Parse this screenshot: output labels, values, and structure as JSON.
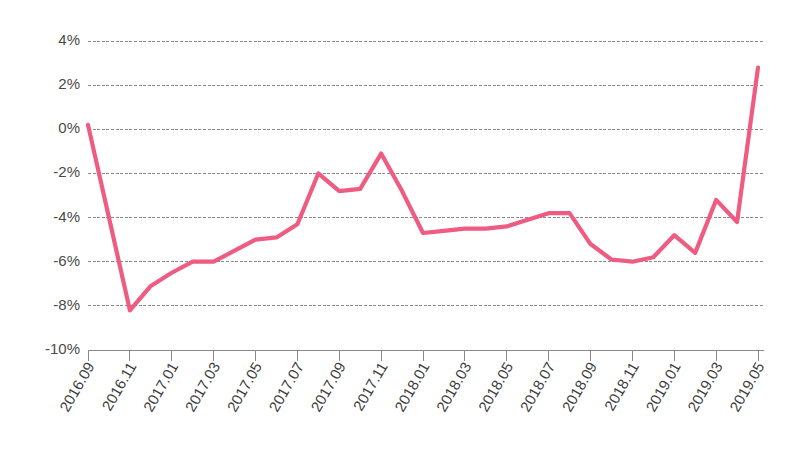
{
  "chart_data": {
    "type": "line",
    "title": "",
    "subtitle": "",
    "xlabel": "",
    "ylabel": "",
    "ylim": [
      -10,
      4
    ],
    "ytick_labels": [
      "4%",
      "2%",
      "0%",
      "-2%",
      "-4%",
      "-6%",
      "-8%",
      "-10%"
    ],
    "ytick_values": [
      4,
      2,
      0,
      -2,
      -4,
      -6,
      -8,
      -10
    ],
    "grid": true,
    "legend": false,
    "legend_position": "none",
    "series_color": "#ef5c82",
    "x": [
      "2016.09",
      "2016.10",
      "2016.11",
      "2016.12",
      "2017.01",
      "2017.02",
      "2017.03",
      "2017.04",
      "2017.05",
      "2017.06",
      "2017.07",
      "2017.08",
      "2017.09",
      "2017.10",
      "2017.11",
      "2017.12",
      "2018.01",
      "2018.02",
      "2018.03",
      "2018.04",
      "2018.05",
      "2018.06",
      "2018.07",
      "2018.08",
      "2018.09",
      "2018.10",
      "2018.11",
      "2018.12",
      "2019.01",
      "2019.02",
      "2019.03",
      "2019.04",
      "2019.05"
    ],
    "xtick_labels": [
      "2016.09",
      "2016.11",
      "2017.01",
      "2017.03",
      "2017.05",
      "2017.07",
      "2017.09",
      "2017.11",
      "2018.01",
      "2018.03",
      "2018.05",
      "2018.07",
      "2018.09",
      "2018.11",
      "2019.01",
      "2019.03",
      "2019.05"
    ],
    "series": [
      {
        "name": "series-1",
        "values": [
          0.2,
          -4.0,
          -8.2,
          -7.1,
          -6.5,
          -6.0,
          -6.0,
          -5.5,
          -5.0,
          -4.9,
          -4.3,
          -2.0,
          -2.8,
          -2.7,
          -1.1,
          -2.8,
          -4.7,
          -4.6,
          -4.5,
          -4.5,
          -4.4,
          -4.1,
          -3.8,
          -3.8,
          -5.2,
          -5.9,
          -6.0,
          -5.8,
          -4.8,
          -5.6,
          -3.2,
          -4.2,
          2.8
        ]
      }
    ]
  }
}
